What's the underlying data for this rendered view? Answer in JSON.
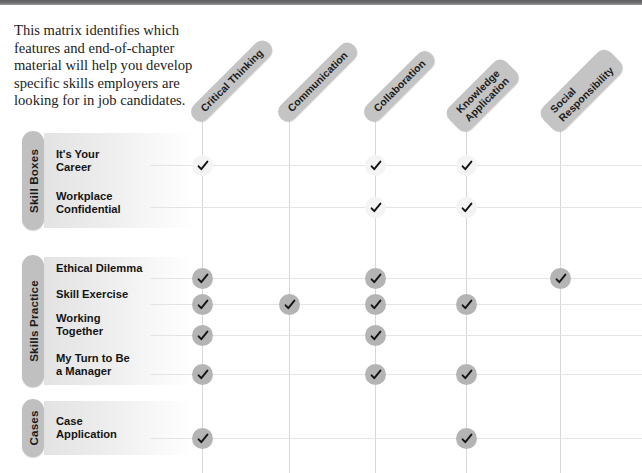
{
  "intro": {
    "text": "This matrix identifies which features and end-of-chapter material will help you develop specific skills employers are looking for in job candidates."
  },
  "colors": {
    "header_pill": "#c4c4c4",
    "group_pill": "#c0c0c0",
    "check_dark": "#b4b4b4",
    "check_light": "#f4f4f4",
    "grid_line": "#d8d8d8",
    "top_bar": "#6e6e70",
    "text": "#1b1b1b"
  },
  "columns": [
    {
      "label": "Critical Thinking",
      "x": 202,
      "lines": 1
    },
    {
      "label": "Communication",
      "x": 289,
      "lines": 1
    },
    {
      "label": "Collaboration",
      "x": 375,
      "lines": 1
    },
    {
      "label": "Knowledge\nApplication",
      "x": 466,
      "lines": 2
    },
    {
      "label": "Social\nResponsibility",
      "x": 560,
      "lines": 2
    }
  ],
  "groups": [
    {
      "name": "Skill Boxes",
      "pill_top": 131,
      "pill_height": 99,
      "shade_top": 133,
      "shade_height": 95,
      "rows": [
        {
          "label": "It's Your\nCareer",
          "label_top": 148,
          "check_y": 155,
          "check_style": "light",
          "marks": [
            true,
            false,
            true,
            true,
            false
          ]
        },
        {
          "label": "Workplace\nConfidential",
          "label_top": 190,
          "check_y": 197,
          "check_style": "light",
          "marks": [
            false,
            false,
            true,
            true,
            false
          ]
        }
      ]
    },
    {
      "name": "Skills Practice",
      "pill_top": 255,
      "pill_height": 132,
      "shade_top": 257,
      "shade_height": 128,
      "rows": [
        {
          "label": "Ethical Dilemma",
          "label_top": 262,
          "check_y": 268,
          "check_style": "dark",
          "marks": [
            true,
            false,
            true,
            false,
            true
          ]
        },
        {
          "label": "Skill Exercise",
          "label_top": 288,
          "check_y": 294,
          "check_style": "dark",
          "marks": [
            true,
            true,
            true,
            true,
            false
          ]
        },
        {
          "label": "Working\nTogether",
          "label_top": 312,
          "check_y": 325,
          "check_style": "dark",
          "marks": [
            true,
            false,
            true,
            false,
            false
          ]
        },
        {
          "label": "My Turn to Be\na Manager",
          "label_top": 352,
          "check_y": 364,
          "check_style": "dark",
          "marks": [
            true,
            false,
            true,
            true,
            false
          ]
        }
      ]
    },
    {
      "name": "Cases",
      "pill_top": 399,
      "pill_height": 58,
      "shade_top": 401,
      "shade_height": 54,
      "rows": [
        {
          "label": "Case\nApplication",
          "label_top": 415,
          "check_y": 428,
          "check_style": "dark",
          "marks": [
            true,
            false,
            false,
            true,
            false
          ]
        }
      ]
    }
  ],
  "grid": {
    "col_line_top": 110,
    "col_line_bottom": 473,
    "row_line_left": 150,
    "row_line_right": 642
  }
}
